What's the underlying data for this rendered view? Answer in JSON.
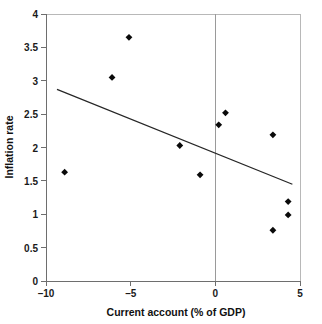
{
  "chart_data": {
    "type": "scatter",
    "title": "",
    "xlabel": "Current account (% of GDP)",
    "ylabel": "Inflation rate",
    "xlim": [
      -10,
      5
    ],
    "ylim": [
      0,
      4
    ],
    "grid": false,
    "legend": false,
    "xticks": [
      -10,
      -5,
      0,
      5
    ],
    "xtick_labels": [
      "–10",
      "–5",
      "0",
      "5"
    ],
    "yticks": [
      0,
      0.5,
      1,
      1.5,
      2,
      2.5,
      3,
      3.5,
      4
    ],
    "ytick_labels": [
      "0",
      "0.5",
      "1",
      "1.5",
      "2",
      "2.5",
      "3",
      "3.5",
      "4"
    ],
    "series": [
      {
        "name": "Countries",
        "marker": "diamond",
        "color": "#0a0a0a",
        "points": [
          {
            "x": -8.9,
            "y": 1.63
          },
          {
            "x": -6.1,
            "y": 3.05
          },
          {
            "x": -5.1,
            "y": 3.65
          },
          {
            "x": -2.1,
            "y": 2.03
          },
          {
            "x": -0.9,
            "y": 1.59
          },
          {
            "x": 0.2,
            "y": 2.34
          },
          {
            "x": 0.6,
            "y": 2.52
          },
          {
            "x": 3.4,
            "y": 2.19
          },
          {
            "x": 3.4,
            "y": 0.76
          },
          {
            "x": 4.3,
            "y": 0.99
          },
          {
            "x": 4.3,
            "y": 1.19
          }
        ]
      }
    ],
    "trendline": {
      "name": "Linear fit",
      "color": "#262626",
      "x_start": -9.35,
      "y_start": 2.87,
      "x_end": 4.55,
      "y_end": 1.45
    },
    "annotations": [
      {
        "name": "zero-reference-line",
        "axis": "x",
        "value": 0
      }
    ]
  },
  "axes": {
    "y_title": "Inflation rate",
    "x_title": "Current account (% of GDP)"
  }
}
